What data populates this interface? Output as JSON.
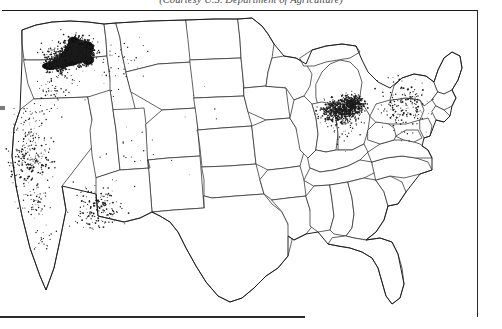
{
  "figure": {
    "credit": "(Courtesy U.S. Department of Agriculture)",
    "frame_color": "#1a1a1a",
    "background_color": "#ffffff",
    "dot_color": "#1c1c1c"
  },
  "chart_data": {
    "type": "map",
    "title": "",
    "subtitle": "",
    "caption": "(Courtesy U.S. Department of Agriculture)",
    "region": "Contiguous United States",
    "symbology": "dot density (one dot = fixed quantity)",
    "grid": false,
    "legend": "none",
    "axis_labels": [],
    "tick_labels": [],
    "annotations": [],
    "clusters": [
      {
        "name": "Palouse (eastern Washington / northern Idaho)",
        "density": "very high",
        "x": 78,
        "y": 52
      },
      {
        "name": "Columbia Plateau, Oregon",
        "density": "high",
        "x": 58,
        "y": 62
      },
      {
        "name": "Michigan Lower Peninsula",
        "density": "medium",
        "x": 338,
        "y": 112
      },
      {
        "name": "Saginaw Bay / Thumb, Michigan",
        "density": "high",
        "x": 352,
        "y": 105
      },
      {
        "name": "California Central Valley",
        "density": "low",
        "x": 30,
        "y": 165
      },
      {
        "name": "Southern Arizona",
        "density": "low",
        "x": 98,
        "y": 210
      },
      {
        "name": "New York / Pennsylvania",
        "density": "low",
        "x": 405,
        "y": 105
      }
    ],
    "empty_regions": [
      "Texas",
      "Great Plains",
      "Dakotas",
      "Minnesota",
      "Missouri",
      "Tennessee",
      "Georgia",
      "Florida"
    ]
  }
}
